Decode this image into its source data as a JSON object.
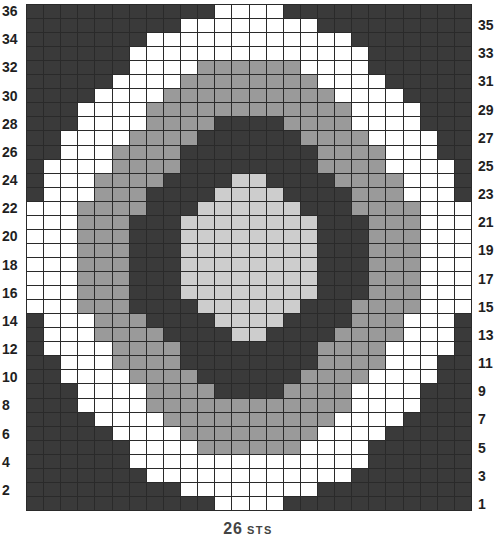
{
  "chart_data": {
    "type": "heatmap",
    "title": "",
    "xlabel": "26 STS",
    "ylabel": "",
    "columns": 26,
    "rows": 36,
    "legend": {
      "D": {
        "name": "dark",
        "color": "#3a3a3a"
      },
      "G": {
        "name": "medium gray",
        "color": "#9a9a9a"
      },
      "L": {
        "name": "light gray",
        "color": "#cdcdcd"
      },
      "W": {
        "name": "white",
        "color": "#ffffff"
      }
    },
    "row_numbers_top_to_bottom": [
      36,
      35,
      34,
      33,
      32,
      31,
      30,
      29,
      28,
      27,
      26,
      25,
      24,
      23,
      22,
      21,
      20,
      19,
      18,
      17,
      16,
      15,
      14,
      13,
      12,
      11,
      10,
      9,
      8,
      7,
      6,
      5,
      4,
      3,
      2,
      1
    ],
    "left_labels": [
      "36",
      "34",
      "32",
      "30",
      "28",
      "26",
      "24",
      "22",
      "20",
      "18",
      "16",
      "14",
      "12",
      "10",
      "8",
      "6",
      "4",
      "2"
    ],
    "right_labels": [
      "35",
      "33",
      "31",
      "29",
      "27",
      "25",
      "23",
      "21",
      "19",
      "17",
      "15",
      "13",
      "11",
      "9",
      "7",
      "5",
      "3",
      "1"
    ],
    "grid_top_to_bottom": [
      "DDDDDDDDDDDWWWWDDDDDDDDDDD",
      "DDDDDDDDDWWWWWWWWDDDDDDDDD",
      "DDDDDDDWWWWWWWWWWWWDDDDDDD",
      "DDDDDDWWWWWWWWWWWWWWDDDDDD",
      "DDDDDDWWWWGGGGGGWWWWDDDDDD",
      "DDDDDWWWWGGGGGGGGWWWWDDDDD",
      "DDDDWWWWGGGGGGGGGGWWWWDDDD",
      "DDDWWWWGGGGGGGGGGGGWWWWDDD",
      "DDDWWWWGGGGDDDDGGGGWWWWDDD",
      "DDWWWWGGGGDDDDDDGGGGWWWWDD",
      "DDWWWGGGGDDDDDDDDGGGGWWWDD",
      "DWWWWGGGGDDDDDDDDGGGGWWWWD",
      "DWWWGGGGDDDDLLDDDDGGGGWWWD",
      "DWWWGGGDDDDLLLLDDDDGGGWWWD",
      "WWWGGGGDDDLLLLLLDDDGGGGWWW",
      "WWWGGGDDDLLLLLLLLDDDGGGWWW",
      "WWWGGGDDDLLLLLLLLDDDGGGWWW",
      "WWWGGGDDDLLLLLLLLDDDGGGWWW",
      "WWWGGGDDDLLLLLLLLDDDGGGWWW",
      "WWWGGGDDDLLLLLLLLDDDGGGWWW",
      "WWWGGGDDDLLLLLLLLDDDGGGWWW",
      "WWWGGGDDDDLLLLLLDDDGGGGWWW",
      "DWWWGGGDDDDLLLLDDDDGGGWWWD",
      "DWWWGGGGDDDDLLDDDDGGGGWWWD",
      "DWWWWGGGGDDDDDDDDGGGGWWWWD",
      "DDWWWGGGGDDDDDDDDGGGGWWWDD",
      "DDWWWWGGGGDDDDDDGGGGWWWWDD",
      "DDDWWWWGGGGDDDDGGGGWWWWDDD",
      "DDDWWWWGGGGGGGGGGGGWWWWDDD",
      "DDDDWWWWGGGGGGGGGGWWWWDDDD",
      "DDDDDWWWWGGGGGGGGWWWWDDDDD",
      "DDDDDDWWWWGGGGGGWWWWDDDDDD",
      "DDDDDDWWWWWWWWWWWWWWDDDDDD",
      "DDDDDDDWWWWWWWWWWWWDDDDDDD",
      "DDDDDDDDDWWWWWWWWDDDDDDDDD",
      "DDDDDDDDDDDWWWWDDDDDDDDDDD"
    ],
    "grid_lines": true,
    "legend_position": "none"
  },
  "caption": {
    "count": "26",
    "unit": "STS"
  }
}
